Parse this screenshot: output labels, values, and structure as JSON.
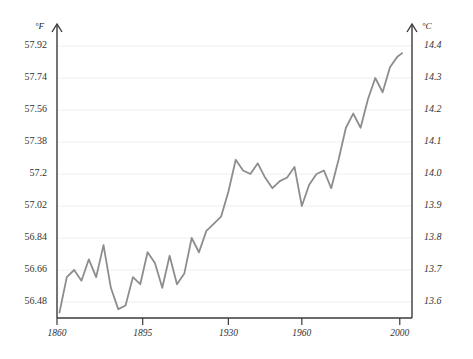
{
  "chart_data": {
    "type": "line",
    "title": "",
    "subtitle": "",
    "xlabel": "",
    "ylabel": "°F",
    "y2label": "°C",
    "grid": true,
    "legend": "none",
    "line_color": "#8d8d8d",
    "axis_color": "#3a3a3a",
    "grid_color": "#efefef",
    "xlim": [
      1860,
      2005
    ],
    "ylim": [
      56.39,
      58.01
    ],
    "y2lim": [
      13.55,
      14.45
    ],
    "xticks": [
      1860,
      1895,
      1930,
      1960,
      2000
    ],
    "xtick_labels": [
      "1860",
      "1895",
      "1930",
      "1960",
      "2000"
    ],
    "yticks": [
      56.48,
      56.66,
      56.84,
      57.02,
      57.2,
      57.38,
      57.56,
      57.74,
      57.92
    ],
    "ytick_labels": [
      "56.48",
      "56.66",
      "56.84",
      "57.02",
      "57.2",
      "57.38",
      "57.56",
      "57.74",
      "57.92"
    ],
    "y2ticks": [
      13.6,
      13.7,
      13.8,
      13.9,
      14.0,
      14.1,
      14.2,
      14.3,
      14.4
    ],
    "y2tick_labels": [
      "13.6",
      "13.7",
      "13.8",
      "13.9",
      "14.0",
      "14.1",
      "14.2",
      "14.3",
      "14.4"
    ],
    "x": [
      1861,
      1864,
      1867,
      1870,
      1873,
      1876,
      1879,
      1882,
      1885,
      1888,
      1891,
      1894,
      1897,
      1900,
      1903,
      1906,
      1909,
      1912,
      1915,
      1918,
      1921,
      1924,
      1927,
      1930,
      1933,
      1936,
      1939,
      1942,
      1945,
      1948,
      1951,
      1954,
      1957,
      1960,
      1963,
      1966,
      1969,
      1972,
      1975,
      1978,
      1981,
      1984,
      1987,
      1990,
      1993,
      1996,
      1999,
      2001
    ],
    "values": [
      56.42,
      56.62,
      56.66,
      56.6,
      56.72,
      56.62,
      56.8,
      56.56,
      56.44,
      56.46,
      56.62,
      56.58,
      56.76,
      56.7,
      56.56,
      56.74,
      56.58,
      56.64,
      56.84,
      56.76,
      56.88,
      56.92,
      56.96,
      57.1,
      57.28,
      57.22,
      57.2,
      57.26,
      57.18,
      57.12,
      57.16,
      57.18,
      57.24,
      57.02,
      57.14,
      57.2,
      57.22,
      57.12,
      57.28,
      57.46,
      57.54,
      57.46,
      57.62,
      57.74,
      57.66,
      57.8,
      57.86,
      57.88
    ],
    "series_name": "Global mean temperature"
  },
  "axes": {
    "left_unit": "°F",
    "right_unit": "°C"
  }
}
